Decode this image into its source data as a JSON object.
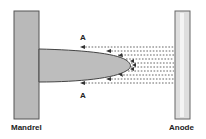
{
  "labels": {
    "mandrel": "Mandrel",
    "anode": "Anode",
    "point_top": "A",
    "point_bottom": "A"
  },
  "colors": {
    "mandrel_fill": "#b9b9b9",
    "anode_fill": "#dedede",
    "deposit_fill": "#bdbdbd",
    "outline": "#444444",
    "field_lines": "#555555"
  }
}
